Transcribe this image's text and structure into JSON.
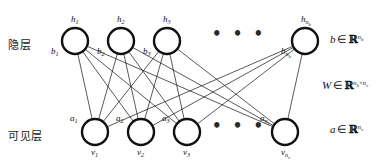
{
  "figure": {
    "background_color": "#ffffff",
    "stroke_color": "#111111"
  },
  "layers": {
    "hidden": {
      "name_label": "隐层",
      "name_label_x": 8,
      "name_label_y": 36,
      "node_radius": 13,
      "node_cy": 41,
      "nodes": [
        {
          "id": "h1",
          "cx": 75,
          "top_label": "h",
          "top_sub": "1",
          "side_label": "b",
          "side_sub": "1"
        },
        {
          "id": "h2",
          "cx": 121,
          "top_label": "h",
          "top_sub": "2",
          "side_label": "b",
          "side_sub": "2"
        },
        {
          "id": "h3",
          "cx": 167,
          "top_label": "h",
          "top_sub": "3",
          "side_label": "b",
          "side_sub": "3"
        },
        {
          "id": "hn",
          "cx": 305,
          "top_label": "h",
          "top_sub": "n",
          "top_sub_sub": "h",
          "side_label": "b",
          "side_sub": "n",
          "side_sub_sub": "h"
        }
      ],
      "ellipsis": {
        "text": "• • •",
        "x": 216,
        "y": 32
      }
    },
    "visible": {
      "name_label": "可见层",
      "name_label_x": 8,
      "name_label_y": 127,
      "node_radius": 13,
      "node_cy": 132,
      "nodes": [
        {
          "id": "v1",
          "cx": 95,
          "bottom_label": "v",
          "bottom_sub": "1",
          "side_label": "a",
          "side_sub": "1"
        },
        {
          "id": "v2",
          "cx": 141,
          "bottom_label": "v",
          "bottom_sub": "2",
          "side_label": "a",
          "side_sub": "2"
        },
        {
          "id": "v3",
          "cx": 187,
          "bottom_label": "v",
          "bottom_sub": "3",
          "side_label": "a",
          "side_sub": "3"
        },
        {
          "id": "vn",
          "cx": 285,
          "bottom_label": "v",
          "bottom_sub": "n",
          "bottom_sub_sub": "v",
          "side_label": "a",
          "side_sub": "n",
          "side_sub_sub": "v"
        }
      ],
      "ellipsis": {
        "text": "• • •",
        "x": 216,
        "y": 124
      }
    }
  },
  "annotations": [
    {
      "id": "bias-hidden",
      "var": "b",
      "op": "∈",
      "set": "ℝ",
      "exp_base": "n",
      "exp_sub": "h",
      "x": 330,
      "y": 34,
      "full_text": "b ∈ ℝ^{n_h}"
    },
    {
      "id": "weights",
      "var": "W",
      "op": "∈",
      "set": "ℝ",
      "exp_base": "n",
      "exp_sub": "h",
      "exp_base2": "n",
      "exp_sub2": "v",
      "exp_times": "×",
      "x": 324,
      "y": 80,
      "full_text": "W ∈ ℝ^{n_h × n_v}"
    },
    {
      "id": "bias-visible",
      "var": "a",
      "op": "∈",
      "set": "ℝ",
      "exp_base": "n",
      "exp_sub": "v",
      "x": 330,
      "y": 124,
      "full_text": "a ∈ ℝ^{n_v}"
    }
  ],
  "edges": {
    "description": "fully connected bipartite edges between every hidden node and every visible node",
    "stroke_width": 0.7,
    "pairs": [
      [
        "h1",
        "v1"
      ],
      [
        "h1",
        "v2"
      ],
      [
        "h1",
        "v3"
      ],
      [
        "h1",
        "vn"
      ],
      [
        "h2",
        "v1"
      ],
      [
        "h2",
        "v2"
      ],
      [
        "h2",
        "v3"
      ],
      [
        "h2",
        "vn"
      ],
      [
        "h3",
        "v1"
      ],
      [
        "h3",
        "v2"
      ],
      [
        "h3",
        "v3"
      ],
      [
        "h3",
        "vn"
      ],
      [
        "hn",
        "v1"
      ],
      [
        "hn",
        "v2"
      ],
      [
        "hn",
        "v3"
      ],
      [
        "hn",
        "vn"
      ]
    ]
  }
}
